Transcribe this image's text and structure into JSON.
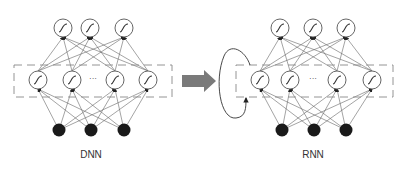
{
  "diagrams": [
    {
      "label": "DNN"
    },
    {
      "label": "RNN"
    }
  ],
  "ellipsis": "···",
  "colors": {
    "line": "#555555",
    "node_fill": "#ffffff",
    "input_fill": "#1a1a1a",
    "arrow": "#7a7a7a",
    "box": "#888888"
  }
}
